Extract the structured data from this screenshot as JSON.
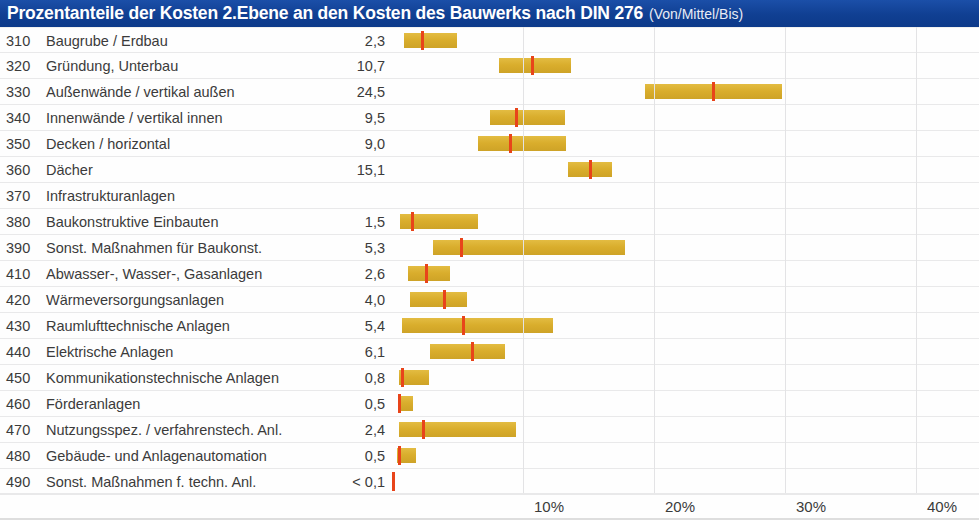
{
  "header": {
    "title": "Prozentanteile der Kosten 2.Ebene an den Kosten des Bauwerks nach DIN 276",
    "subtitle": "(Von/Mittel/Bis)",
    "bar_color": "#14459b",
    "text_color": "#ffffff"
  },
  "colors": {
    "range_bar": "#dfb531",
    "mean_marker": "#e8441a",
    "gridline": "#e3e3e5",
    "row_text": "#3b3b3b"
  },
  "chart_data": {
    "type": "bar",
    "title": "Prozentanteile der Kosten 2.Ebene an den Kosten des Bauwerks nach DIN 276",
    "subtitle": "(Von/Mittel/Bis)",
    "xlabel": "",
    "ylabel": "",
    "xlim": [
      0,
      43
    ],
    "xticks": [
      10,
      20,
      30,
      40
    ],
    "xticklabels": [
      "10%",
      "20%",
      "30%",
      "40%"
    ],
    "grid": true,
    "legend": "none",
    "orientation": "horizontal",
    "categories": [
      "310 Baugrube / Erdbau",
      "320 Gründung, Unterbau",
      "330 Außenwände / vertikal außen",
      "340 Innenwände / vertikal innen",
      "350 Decken / horizontal",
      "360 Dächer",
      "370 Infrastrukturanlagen",
      "380 Baukonstruktive Einbauten",
      "390 Sonst. Maßnahmen für Baukonst.",
      "410 Abwasser-, Wasser-, Gasanlagen",
      "420 Wärmeversorgungsanlagen",
      "430 Raumlufttechnische Anlagen",
      "440 Elektrische Anlagen",
      "450 Kommunikationstechnische Anlagen",
      "460 Förderanlagen",
      "470 Nutzungsspez. / verfahrenstech. Anl.",
      "480 Gebäude- und Anlagenautomation",
      "490 Sonst. Maßnahmen f. techn. Anl."
    ],
    "values": [
      2.3,
      10.7,
      24.5,
      9.5,
      9.0,
      15.1,
      null,
      1.5,
      5.3,
      2.6,
      4.0,
      5.4,
      6.1,
      0.8,
      0.5,
      2.4,
      0.5,
      0.05
    ],
    "series": [
      {
        "name": "Von",
        "values": [
          0.9,
          8.2,
          19.3,
          7.5,
          6.6,
          13.4,
          null,
          0.6,
          3.1,
          1.2,
          1.4,
          0.8,
          2.9,
          0.5,
          0.5,
          0.5,
          0.4,
          0.0
        ]
      },
      {
        "name": "Mittel",
        "values": [
          2.3,
          10.7,
          24.5,
          9.5,
          9.0,
          15.1,
          null,
          1.5,
          5.3,
          2.6,
          4.0,
          5.4,
          6.1,
          0.8,
          0.5,
          2.4,
          0.5,
          0.05
        ]
      },
      {
        "name": "Bis",
        "values": [
          5.0,
          13.7,
          29.8,
          13.2,
          13.3,
          16.8,
          null,
          6.6,
          17.8,
          4.4,
          5.7,
          12.3,
          8.6,
          2.8,
          1.6,
          9.5,
          1.8,
          0.1
        ]
      }
    ]
  },
  "rows": [
    {
      "code": "310",
      "label": "Baugrube / Erdbau",
      "value": "2,3",
      "from": 0.9,
      "mean": 2.3,
      "to": 5.0
    },
    {
      "code": "320",
      "label": "Gründung, Unterbau",
      "value": "10,7",
      "from": 8.2,
      "mean": 10.7,
      "to": 13.7
    },
    {
      "code": "330",
      "label": "Außenwände / vertikal außen",
      "value": "24,5",
      "from": 19.3,
      "mean": 24.5,
      "to": 29.8
    },
    {
      "code": "340",
      "label": "Innenwände / vertikal innen",
      "value": "9,5",
      "from": 7.5,
      "mean": 9.5,
      "to": 13.2
    },
    {
      "code": "350",
      "label": "Decken / horizontal",
      "value": "9,0",
      "from": 6.6,
      "mean": 9.0,
      "to": 13.3
    },
    {
      "code": "360",
      "label": "Dächer",
      "value": "15,1",
      "from": 13.4,
      "mean": 15.1,
      "to": 16.8
    },
    {
      "code": "370",
      "label": "Infrastrukturanlagen",
      "value": "",
      "from": null,
      "mean": null,
      "to": null
    },
    {
      "code": "380",
      "label": "Baukonstruktive Einbauten",
      "value": "1,5",
      "from": 0.6,
      "mean": 1.5,
      "to": 6.6
    },
    {
      "code": "390",
      "label": "Sonst. Maßnahmen für Baukonst.",
      "value": "5,3",
      "from": 3.1,
      "mean": 5.3,
      "to": 17.8
    },
    {
      "code": "410",
      "label": "Abwasser-, Wasser-, Gasanlagen",
      "value": "2,6",
      "from": 1.2,
      "mean": 2.6,
      "to": 4.4
    },
    {
      "code": "420",
      "label": "Wärmeversorgungsanlagen",
      "value": "4,0",
      "from": 1.4,
      "mean": 4.0,
      "to": 5.7
    },
    {
      "code": "430",
      "label": "Raumlufttechnische Anlagen",
      "value": "5,4",
      "from": 0.8,
      "mean": 5.4,
      "to": 12.3
    },
    {
      "code": "440",
      "label": "Elektrische Anlagen",
      "value": "6,1",
      "from": 2.9,
      "mean": 6.1,
      "to": 8.6
    },
    {
      "code": "450",
      "label": "Kommunikationstechnische Anlagen",
      "value": "0,8",
      "from": 0.5,
      "mean": 0.8,
      "to": 2.8
    },
    {
      "code": "460",
      "label": "Förderanlagen",
      "value": "0,5",
      "from": 0.5,
      "mean": 0.5,
      "to": 1.6
    },
    {
      "code": "470",
      "label": "Nutzungsspez. / verfahrenstech. Anl.",
      "value": "2,4",
      "from": 0.5,
      "mean": 2.4,
      "to": 9.5
    },
    {
      "code": "480",
      "label": "Gebäude- und Anlagenautomation",
      "value": "0,5",
      "from": 0.4,
      "mean": 0.5,
      "to": 1.8
    },
    {
      "code": "490",
      "label": "Sonst. Maßnahmen f. techn. Anl.",
      "value": "< 0,1",
      "from": 0.0,
      "mean": 0.05,
      "to": 0.1
    }
  ],
  "axis": {
    "ticks": [
      "10%",
      "20%",
      "30%",
      "40%"
    ],
    "tick_values": [
      10,
      20,
      30,
      40
    ]
  }
}
